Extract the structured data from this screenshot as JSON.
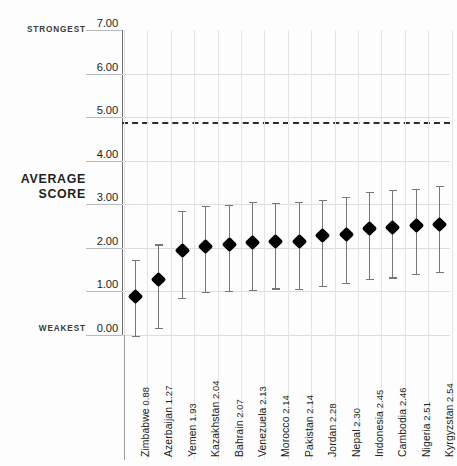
{
  "annotations": {
    "strongest": "STRONGEST",
    "weakest": "WEAKEST",
    "average_line1": "AVERAGE",
    "average_line2": "SCORE"
  },
  "axis": {
    "y_ticks": [
      "7.00",
      "6.00",
      "5.00",
      "4.00",
      "3.00",
      "2.00",
      "1.00",
      "0.00"
    ]
  },
  "colors": {
    "marker": "#000000",
    "whisker": "#777777",
    "grid": "#e4e4e4",
    "gridline_major": "#dedede",
    "axis": "#6d6d6d",
    "threshold": "#2c2c2c",
    "text": "#231f20",
    "background": "#fdfdfd"
  },
  "chart_data": {
    "type": "scatter",
    "title": "",
    "subtitle": "",
    "xlabel": "",
    "ylabel": "AVERAGE SCORE",
    "ylim": [
      0,
      7
    ],
    "y_ticks": [
      0,
      1,
      2,
      3,
      4,
      5,
      6,
      7
    ],
    "grid": true,
    "legend": "none",
    "error_bars": "asymmetric range (min–max)",
    "annotations": [
      {
        "text": "STRONGEST",
        "at_y": 7.0,
        "position": "left-of-axis"
      },
      {
        "text": "WEAKEST",
        "at_y": 0.0,
        "position": "left-of-axis"
      },
      {
        "text": "AVERAGE SCORE",
        "at_y": 3.3,
        "position": "left-axis-title"
      }
    ],
    "reference_line": {
      "value": 4.88,
      "style": "dashed",
      "color": "#2c2c2c"
    },
    "categories": [
      "Zimbabwe",
      "Azerbaijan",
      "Yemen",
      "Kazakhstan",
      "Bahrain",
      "Venezuela",
      "Morocco",
      "Pakistan",
      "Jordan",
      "Nepal",
      "Indonesia",
      "Cambodia",
      "Nigeria",
      "Kyrgyzstan"
    ],
    "values": [
      0.88,
      1.27,
      1.93,
      2.04,
      2.07,
      2.13,
      2.14,
      2.14,
      2.28,
      2.3,
      2.45,
      2.46,
      2.51,
      2.54
    ],
    "error_low": [
      -0.02,
      0.17,
      0.85,
      0.99,
      1.01,
      1.04,
      1.07,
      1.06,
      1.13,
      1.19,
      1.29,
      1.32,
      1.4,
      1.45
    ],
    "error_high": [
      1.73,
      2.08,
      2.85,
      2.96,
      2.98,
      3.05,
      3.04,
      3.05,
      3.1,
      3.17,
      3.29,
      3.33,
      3.35,
      3.43
    ]
  },
  "points": [
    {
      "country": "Zimbabwe",
      "score": "0.88",
      "label": "Zimbabwe 0.88",
      "value": 0.88,
      "low": -0.02,
      "high": 1.73
    },
    {
      "country": "Azerbaijan",
      "score": "1.27",
      "label": "Azerbaijan 1.27",
      "value": 1.27,
      "low": 0.17,
      "high": 2.08
    },
    {
      "country": "Yemen",
      "score": "1.93",
      "label": "Yemen 1.93",
      "value": 1.93,
      "low": 0.85,
      "high": 2.85
    },
    {
      "country": "Kazakhstan",
      "score": "2.04",
      "label": "Kazakhstan 2.04",
      "value": 2.04,
      "low": 0.99,
      "high": 2.96
    },
    {
      "country": "Bahrain",
      "score": "2.07",
      "label": "Bahrain 2.07",
      "value": 2.07,
      "low": 1.01,
      "high": 2.98
    },
    {
      "country": "Venezuela",
      "score": "2.13",
      "label": "Venezuela 2.13",
      "value": 2.13,
      "low": 1.04,
      "high": 3.05
    },
    {
      "country": "Morocco",
      "score": "2.14",
      "label": "Morocco 2.14",
      "value": 2.14,
      "low": 1.07,
      "high": 3.04
    },
    {
      "country": "Pakistan",
      "score": "2.14",
      "label": "Pakistan 2.14",
      "value": 2.14,
      "low": 1.06,
      "high": 3.05
    },
    {
      "country": "Jordan",
      "score": "2.28",
      "label": "Jordan 2.28",
      "value": 2.28,
      "low": 1.13,
      "high": 3.1
    },
    {
      "country": "Nepal",
      "score": "2.30",
      "label": "Nepal 2.30",
      "value": 2.3,
      "low": 1.19,
      "high": 3.17
    },
    {
      "country": "Indonesia",
      "score": "2.45",
      "label": "Indonesia 2.45",
      "value": 2.45,
      "low": 1.29,
      "high": 3.29
    },
    {
      "country": "Cambodia",
      "score": "2.46",
      "label": "Cambodia 2.46",
      "value": 2.46,
      "low": 1.32,
      "high": 3.33
    },
    {
      "country": "Nigeria",
      "score": "2.51",
      "label": "Nigeria 2.51",
      "value": 2.51,
      "low": 1.4,
      "high": 3.35
    },
    {
      "country": "Kyrgyzstan",
      "score": "2.54",
      "label": "Kyrgyzstan 2.54",
      "value": 2.54,
      "low": 1.45,
      "high": 3.43
    }
  ]
}
